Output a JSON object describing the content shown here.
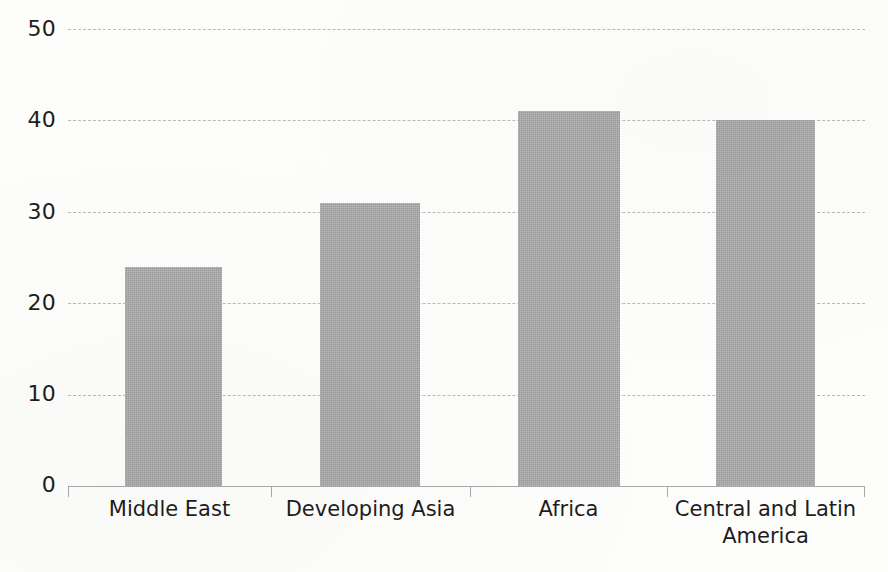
{
  "chart_data": {
    "type": "bar",
    "title": "",
    "subtitle": "",
    "xlabel": "",
    "ylabel": "",
    "categories": [
      "Middle East",
      "Developing Asia",
      "Africa",
      "Central and Latin America"
    ],
    "values": [
      24,
      31,
      41,
      40
    ],
    "series": [
      {
        "name": "",
        "values": [
          24,
          31,
          41,
          40
        ]
      }
    ],
    "ylim": [
      0,
      50
    ],
    "yticks": [
      0,
      10,
      20,
      30,
      40,
      50
    ],
    "ytick_labels": [
      "0",
      "10",
      "20",
      "30",
      "40",
      "50"
    ],
    "grid": "horizontal-dashed",
    "legend": "none",
    "bar_color": "#a8a8a8",
    "gridline_color": "#b9b9b9",
    "axis_color": "#a9a9a9",
    "text_color": "#1d1d1d",
    "background_color": "#fdfdfb"
  },
  "axis": {
    "y": {
      "t50": "50",
      "t40": "40",
      "t30": "30",
      "t20": "20",
      "t10": "10",
      "t0": "0"
    },
    "x": {
      "c0": "Middle East",
      "c1": "Developing Asia",
      "c2": "Africa",
      "c3_line1": "Central and Latin",
      "c3_line2": "America"
    }
  }
}
